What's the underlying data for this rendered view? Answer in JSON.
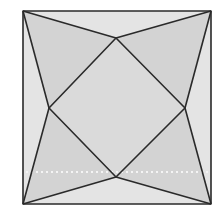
{
  "diagram": {
    "type": "geometric-figure",
    "square": {
      "x1": 23,
      "y1": 11,
      "x2": 211,
      "y2": 204
    },
    "inner_points": {
      "top": [
        116,
        38
      ],
      "right": [
        185,
        108
      ],
      "bottom": [
        116,
        177
      ],
      "left": [
        49,
        108
      ]
    },
    "dashed_line_y": 172,
    "colors": {
      "background": "#ffffff",
      "light_region": "#e4e4e4",
      "dark_region": "#d3d3d3",
      "center": "#dadada",
      "stroke": "#2a2a2a",
      "dashed": "#f4f4f4"
    }
  }
}
